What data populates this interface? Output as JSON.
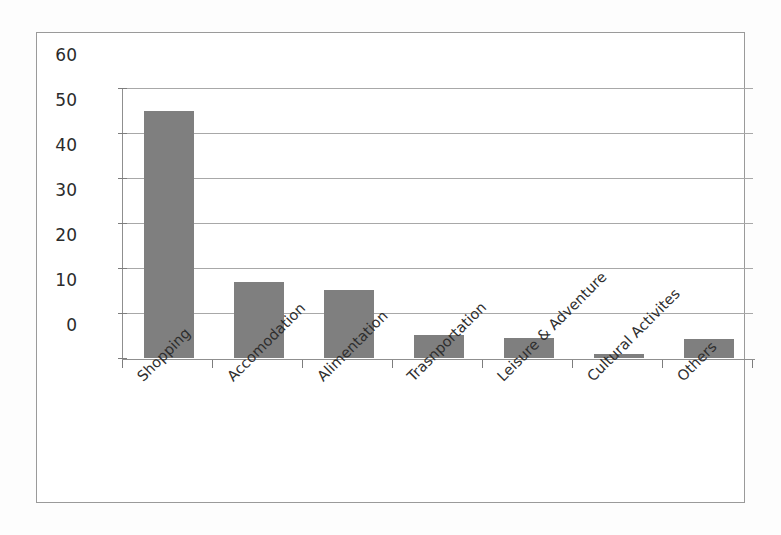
{
  "chart_data": {
    "type": "bar",
    "title": "",
    "subtitle": "",
    "xlabel": "",
    "ylabel": "",
    "categories": [
      "Shopping",
      "Accomodation",
      "Alimentation",
      "Trasnportation",
      "Leisure & Adventure",
      "Cultural Activites",
      "Others"
    ],
    "values": [
      55,
      17,
      15.2,
      5.2,
      4.5,
      1,
      4.2
    ],
    "series": [
      {
        "name": "",
        "values": [
          55,
          17,
          15.2,
          5.2,
          4.5,
          1,
          4.2
        ]
      }
    ],
    "ylim": [
      0,
      60
    ],
    "ytick_values": [
      0,
      10,
      20,
      30,
      40,
      50,
      60
    ],
    "ytick_labels": [
      "0",
      "10",
      "20",
      "30",
      "40",
      "50",
      "60"
    ],
    "grid": "horizontal",
    "legend": "none",
    "bar_color": "#7f7f7f",
    "gridline_color": "#a8a8a8",
    "axis_color": "#8f8f8f",
    "plot_background": "#ffffff",
    "xtick_label_rotation": "-45",
    "annotations": []
  }
}
